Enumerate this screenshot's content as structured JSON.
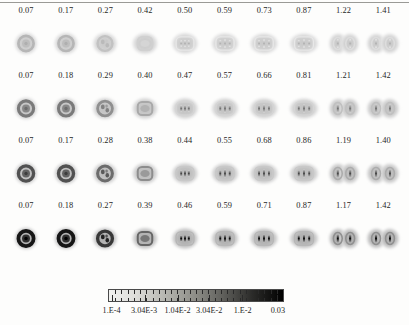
{
  "figure": {
    "type": "panel-grid-image-series",
    "rows": 4,
    "columns": 10
  },
  "chart_data": {
    "type": "heatmap",
    "title": "",
    "xlabel": "",
    "ylabel": "",
    "grid": false,
    "legend_position": "bottom",
    "panel_rows": [
      {
        "row_index": 1,
        "labels": [
          "0.07",
          "0.17",
          "0.27",
          "0.42",
          "0.50",
          "0.59",
          "0.73",
          "0.87",
          "1.22",
          "1.41"
        ],
        "values": [
          0.07,
          0.17,
          0.27,
          0.42,
          0.5,
          0.59,
          0.73,
          0.87,
          1.22,
          1.41
        ],
        "intensity": 0.62,
        "core_darkness": 0.3
      },
      {
        "row_index": 2,
        "labels": [
          "0.07",
          "0.18",
          "0.29",
          "0.40",
          "0.47",
          "0.57",
          "0.66",
          "0.81",
          "1.21",
          "1.42"
        ],
        "values": [
          0.07,
          0.18,
          0.29,
          0.4,
          0.47,
          0.57,
          0.66,
          0.81,
          1.21,
          1.42
        ],
        "intensity": 0.72,
        "core_darkness": 0.55
      },
      {
        "row_index": 3,
        "labels": [
          "0.07",
          "0.17",
          "0.28",
          "0.38",
          "0.44",
          "0.55",
          "0.68",
          "0.86",
          "1.19",
          "1.40"
        ],
        "values": [
          0.07,
          0.17,
          0.28,
          0.38,
          0.44,
          0.55,
          0.68,
          0.86,
          1.19,
          1.4
        ],
        "intensity": 0.8,
        "core_darkness": 0.72
      },
      {
        "row_index": 4,
        "labels": [
          "0.07",
          "0.18",
          "0.27",
          "0.39",
          "0.46",
          "0.59",
          "0.71",
          "0.87",
          "1.17",
          "1.42"
        ],
        "values": [
          0.07,
          0.18,
          0.27,
          0.39,
          0.46,
          0.59,
          0.71,
          0.87,
          1.17,
          1.42
        ],
        "intensity": 0.95,
        "core_darkness": 0.97
      }
    ],
    "shape_progression": [
      "concentric-ring",
      "concentric-ring",
      "ring-with-substructure",
      "rounded-square",
      "rounded-square-banded",
      "banded-elongated",
      "banded-elongated",
      "banded-elongated",
      "double-lobe",
      "double-lobe"
    ],
    "colorbar": {
      "orientation": "horizontal",
      "scale": "logarithmic",
      "gradient_from": "#f2f2f0",
      "gradient_to": "#000000",
      "tick_labels": [
        "1.E-4",
        "3.04E-3",
        "1.04E-2",
        "3.04E-2",
        "1.E-2",
        "0.03"
      ],
      "tick_positions": [
        0.02,
        0.205,
        0.395,
        0.575,
        0.765,
        0.965
      ],
      "minor_tick_count": 28
    }
  },
  "colors": {
    "page_background": "#fdfdfc",
    "ink": "#1a1a1a",
    "rule": "#9a9a96",
    "panel_halo": "#b9b9b4",
    "panel_core_light": "#c9c9c4",
    "panel_core_dark": "#111111"
  }
}
